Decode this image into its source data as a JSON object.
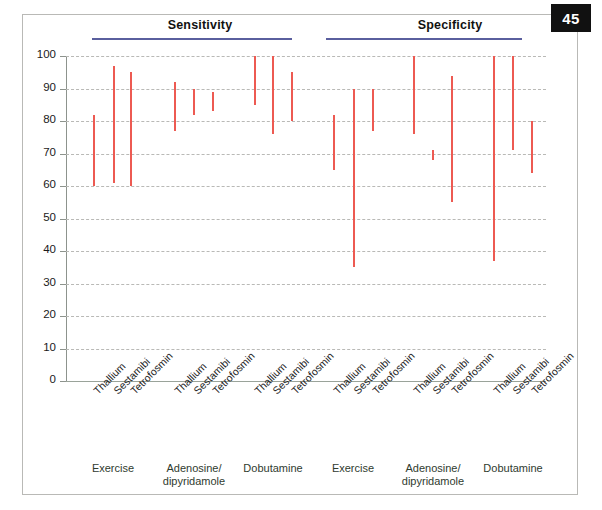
{
  "page": {
    "badge_number": "45"
  },
  "sections": [
    {
      "title": "Sensitivity"
    },
    {
      "title": "Specificity"
    }
  ],
  "axis": {
    "y_ticks": [
      "100",
      "90",
      "80",
      "70",
      "60",
      "50",
      "40",
      "30",
      "20",
      "10",
      "0"
    ],
    "y_min": 0,
    "y_max": 100
  },
  "tracers": [
    "Thallium",
    "Sestamibi",
    "Tetrofosmin"
  ],
  "stressors": [
    "Exercise",
    "Adenosine/\ndipyridamole",
    "Dobutamine"
  ],
  "group_labels": [
    {
      "line1": "Exercise",
      "line2": ""
    },
    {
      "line1": "Adenosine/",
      "line2": "dipyridamole"
    },
    {
      "line1": "Dobutamine",
      "line2": ""
    },
    {
      "line1": "Exercise",
      "line2": ""
    },
    {
      "line1": "Adenosine/",
      "line2": "dipyridamole"
    },
    {
      "line1": "Dobutamine",
      "line2": ""
    }
  ],
  "colors": {
    "bar": "#ed5a52",
    "rule": "#5a5f9e",
    "grid": "#b9b9b6",
    "axis": "#8d938d",
    "badge_bg": "#111111",
    "group_label": "#2f3b2f"
  },
  "chart_data": {
    "type": "bar",
    "xlabel": "",
    "ylabel": "",
    "ylim": [
      0,
      100
    ],
    "y_ticks": [
      0,
      10,
      20,
      30,
      40,
      50,
      60,
      70,
      80,
      90,
      100
    ],
    "grid": true,
    "legend": "none",
    "value_type": "range (low-high)",
    "panels": [
      {
        "name": "Sensitivity",
        "groups": [
          {
            "stressor": "Exercise",
            "bars": [
              {
                "tracer": "Thallium",
                "low": 60,
                "high": 82
              },
              {
                "tracer": "Sestamibi",
                "low": 61,
                "high": 97
              },
              {
                "tracer": "Tetrofosmin",
                "low": 60,
                "high": 95
              }
            ]
          },
          {
            "stressor": "Adenosine/dipyridamole",
            "bars": [
              {
                "tracer": "Thallium",
                "low": 77,
                "high": 92
              },
              {
                "tracer": "Sestamibi",
                "low": 82,
                "high": 90
              },
              {
                "tracer": "Tetrofosmin",
                "low": 83,
                "high": 89
              }
            ]
          },
          {
            "stressor": "Dobutamine",
            "bars": [
              {
                "tracer": "Thallium",
                "low": 85,
                "high": 100
              },
              {
                "tracer": "Sestamibi",
                "low": 76,
                "high": 100
              },
              {
                "tracer": "Tetrofosmin",
                "low": 80,
                "high": 95
              }
            ]
          }
        ]
      },
      {
        "name": "Specificity",
        "groups": [
          {
            "stressor": "Exercise",
            "bars": [
              {
                "tracer": "Thallium",
                "low": 65,
                "high": 82
              },
              {
                "tracer": "Sestamibi",
                "low": 35,
                "high": 90
              },
              {
                "tracer": "Tetrofosmin",
                "low": 77,
                "high": 90
              }
            ]
          },
          {
            "stressor": "Adenosine/dipyridamole",
            "bars": [
              {
                "tracer": "Thallium",
                "low": 76,
                "high": 100
              },
              {
                "tracer": "Sestamibi",
                "low": 68,
                "high": 71
              },
              {
                "tracer": "Tetrofosmin",
                "low": 55,
                "high": 94
              }
            ]
          },
          {
            "stressor": "Dobutamine",
            "bars": [
              {
                "tracer": "Thallium",
                "low": 37,
                "high": 100
              },
              {
                "tracer": "Sestamibi",
                "low": 71,
                "high": 100
              },
              {
                "tracer": "Tetrofosmin",
                "low": 64,
                "high": 80
              }
            ]
          }
        ]
      }
    ]
  }
}
